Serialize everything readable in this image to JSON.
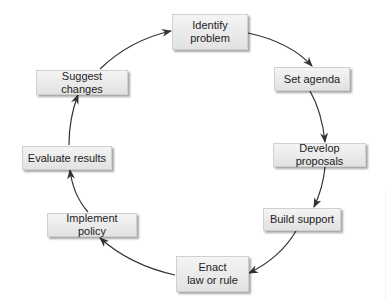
{
  "diagram": {
    "type": "cycle",
    "title": "",
    "colors": {
      "box_fill_top": "#f4f4f4",
      "box_fill_bottom": "#e2e2e2",
      "arrow": "#333333",
      "text": "#222222"
    },
    "nodes": [
      {
        "id": "identify",
        "line1": "Identify",
        "line2": "problem"
      },
      {
        "id": "agenda",
        "line1": "Set agenda",
        "line2": ""
      },
      {
        "id": "proposals",
        "line1": "Develop proposals",
        "line2": ""
      },
      {
        "id": "support",
        "line1": "Build support",
        "line2": ""
      },
      {
        "id": "enact",
        "line1": "Enact",
        "line2": "law or rule"
      },
      {
        "id": "implement",
        "line1": "Implement policy",
        "line2": ""
      },
      {
        "id": "evaluate",
        "line1": "Evaluate results",
        "line2": ""
      },
      {
        "id": "suggest",
        "line1": "Suggest changes",
        "line2": ""
      }
    ],
    "edges": [
      {
        "from": "identify",
        "to": "agenda"
      },
      {
        "from": "agenda",
        "to": "proposals"
      },
      {
        "from": "proposals",
        "to": "support"
      },
      {
        "from": "support",
        "to": "enact"
      },
      {
        "from": "enact",
        "to": "implement"
      },
      {
        "from": "implement",
        "to": "evaluate"
      },
      {
        "from": "evaluate",
        "to": "suggest"
      },
      {
        "from": "suggest",
        "to": "identify"
      }
    ]
  }
}
